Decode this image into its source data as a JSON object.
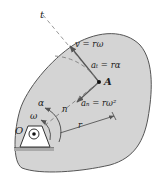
{
  "diagram": {
    "colors": {
      "body_fill": "#d4d4d4",
      "body_stroke": "#555555",
      "vector": "#555555",
      "dashed": "#888888",
      "text": "#222222"
    },
    "labels": {
      "tangent_axis": "t",
      "velocity": "v = rω",
      "tangential_accel": "aₜ = rα",
      "point": "A",
      "normal_accel": "aₙ = rω²",
      "normal_axis": "n",
      "radius": "r",
      "angular_accel": "α",
      "angular_velocity": "ω",
      "pivot": "O"
    }
  }
}
